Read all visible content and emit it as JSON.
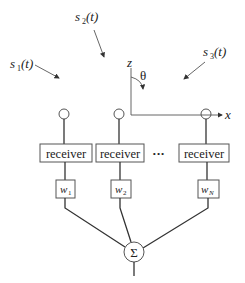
{
  "sources": [
    {
      "name": "s",
      "sub": "1",
      "arg": "(t)"
    },
    {
      "name": "s",
      "sub": "2",
      "arg": "(t)"
    },
    {
      "name": "s",
      "sub": "3",
      "arg": "(t)"
    }
  ],
  "axes": {
    "z_label": "z",
    "x_label": "x",
    "angle_label": "θ"
  },
  "receivers": [
    {
      "label": "receiver"
    },
    {
      "label": "receiver"
    },
    {
      "label": "receiver"
    }
  ],
  "ellipsis": "•••",
  "weights": [
    {
      "name": "w",
      "sub": "1"
    },
    {
      "name": "w",
      "sub": "2"
    },
    {
      "name": "w",
      "sub": "N"
    }
  ],
  "summer": {
    "symbol": "Σ"
  }
}
